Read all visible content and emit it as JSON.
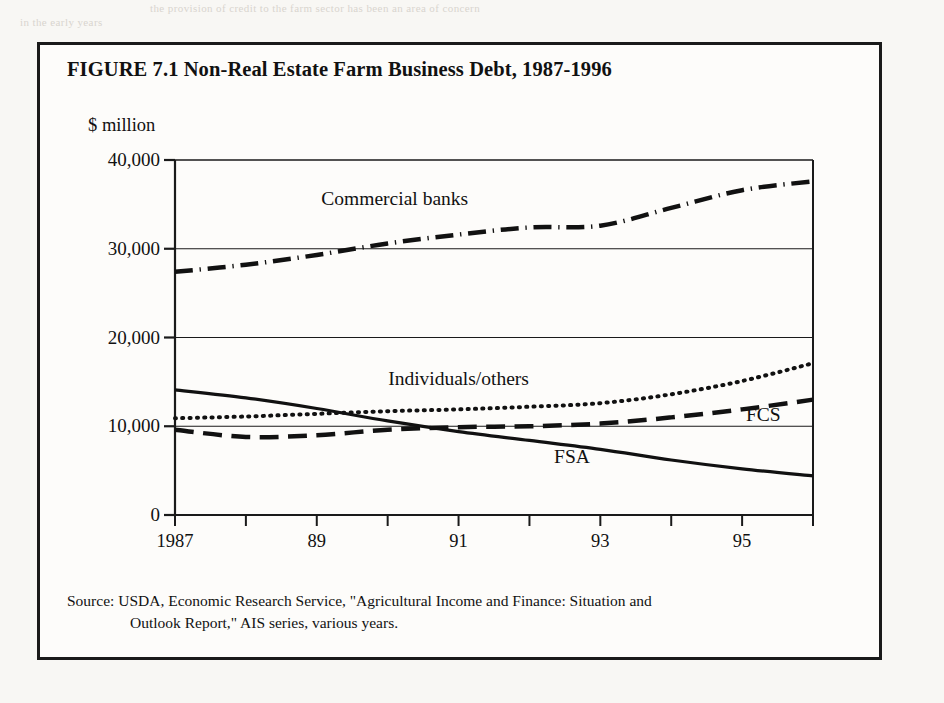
{
  "page": {
    "background_color": "#f8f7f4",
    "border_color": "#1a1a1a",
    "bleed_text_top": "the provision of credit to the farm sector has been an area of concern",
    "bleed_text_second": "in the early years"
  },
  "figure": {
    "title": "FIGURE 7.1   Non-Real Estate Farm Business Debt, 1987-1996",
    "y_axis_unit": "$ million",
    "source_line_1": "Source:  USDA, Economic Research Service, \"Agricultural Income and Finance: Situation and",
    "source_line_2": "Outlook Report,\" AIS series, various years."
  },
  "chart_data": {
    "type": "line",
    "title": "Non-Real Estate Farm Business Debt, 1987-1996",
    "xlabel": "",
    "ylabel": "$ million",
    "ylim": [
      0,
      40000
    ],
    "xlim": [
      1987,
      1996
    ],
    "grid": "horizontal",
    "legend": "inline-annotations",
    "y_ticks": [
      0,
      10000,
      20000,
      30000,
      40000
    ],
    "y_tick_labels": [
      "0",
      "10,000",
      "20,000",
      "30,000",
      "40,000"
    ],
    "x": [
      1987,
      1988,
      1989,
      1990,
      1991,
      1992,
      1993,
      1994,
      1995,
      1996
    ],
    "x_tick_labels": [
      "1987",
      "",
      "89",
      "",
      "91",
      "",
      "93",
      "",
      "95",
      ""
    ],
    "x_tick_labels_shown": [
      "1987",
      "89",
      "91",
      "93",
      "95"
    ],
    "series": [
      {
        "name": "Commercial banks",
        "line_style": "dash-dot",
        "color": "#111111",
        "width": 4.5,
        "label_x": 1990.1,
        "label_y": 35600,
        "values": [
          27400,
          28200,
          29300,
          30600,
          31600,
          32400,
          32600,
          34600,
          36600,
          37600
        ]
      },
      {
        "name": "Individuals/others",
        "line_style": "dotted",
        "color": "#111111",
        "width": 4.0,
        "label_x": 1991.0,
        "label_y": 15300,
        "values": [
          10900,
          11100,
          11400,
          11700,
          11900,
          12200,
          12600,
          13600,
          15100,
          17100
        ]
      },
      {
        "name": "FCS",
        "line_style": "dashed",
        "color": "#111111",
        "width": 4.5,
        "label_x": 1995.3,
        "label_y": 11300,
        "values": [
          9600,
          8800,
          9000,
          9600,
          9900,
          10000,
          10300,
          11000,
          11900,
          13000
        ]
      },
      {
        "name": "FSA",
        "line_style": "solid",
        "color": "#111111",
        "width": 3.2,
        "label_x": 1992.6,
        "label_y": 6500,
        "values": [
          14100,
          13200,
          12000,
          10600,
          9400,
          8400,
          7400,
          6200,
          5200,
          4400
        ]
      }
    ]
  }
}
